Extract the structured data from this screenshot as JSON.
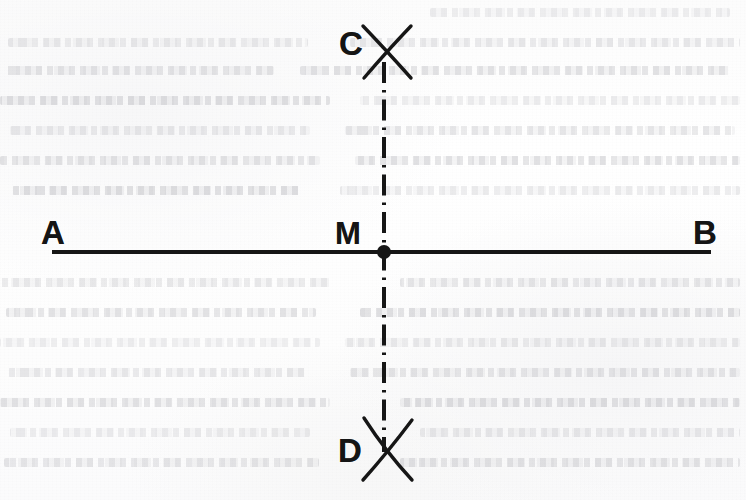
{
  "figure": {
    "kind": "geometry-construction",
    "background_color": "#fdfdfd",
    "ink_color": "#151515"
  },
  "labels": {
    "a": "A",
    "b": "B",
    "m": "M",
    "c": "C",
    "d": "D"
  },
  "elements": {
    "segment_ab": {
      "name": "AB",
      "style": "solid",
      "x1": 52,
      "y1": 252,
      "x2": 711,
      "y2": 252,
      "stroke_width": 4
    },
    "perpendicular_cd": {
      "name": "CD",
      "style": "dash-dot",
      "x1": 384,
      "y1": 62,
      "x2": 384,
      "y2": 452,
      "stroke_width": 4
    },
    "midpoint_m": {
      "name": "M",
      "shape": "filled-dot",
      "cx": 384,
      "cy": 252,
      "r": 7
    },
    "arc_cross_c": {
      "name": "C",
      "cx": 385,
      "cy": 50,
      "x_min": 363,
      "x_max": 411,
      "y_min": 26,
      "y_max": 78
    },
    "arc_cross_d": {
      "name": "D",
      "cx": 385,
      "cy": 455,
      "x_min": 363,
      "x_max": 411,
      "y_min": 418,
      "y_max": 480
    }
  },
  "bleed_through_lines": [
    {
      "left": 430,
      "top": 8,
      "width": 300
    },
    {
      "left": 8,
      "top": 38,
      "width": 300
    },
    {
      "left": 350,
      "top": 38,
      "width": 390
    },
    {
      "left": 4,
      "top": 66,
      "width": 270
    },
    {
      "left": 300,
      "top": 66,
      "width": 430
    },
    {
      "left": 0,
      "top": 96,
      "width": 330
    },
    {
      "left": 360,
      "top": 96,
      "width": 380
    },
    {
      "left": 10,
      "top": 126,
      "width": 300
    },
    {
      "left": 345,
      "top": 126,
      "width": 390
    },
    {
      "left": 0,
      "top": 156,
      "width": 320
    },
    {
      "left": 355,
      "top": 156,
      "width": 385
    },
    {
      "left": 12,
      "top": 186,
      "width": 290
    },
    {
      "left": 340,
      "top": 186,
      "width": 400
    },
    {
      "left": 0,
      "top": 278,
      "width": 330
    },
    {
      "left": 400,
      "top": 278,
      "width": 340
    },
    {
      "left": 6,
      "top": 308,
      "width": 310
    },
    {
      "left": 360,
      "top": 308,
      "width": 380
    },
    {
      "left": 0,
      "top": 338,
      "width": 320
    },
    {
      "left": 345,
      "top": 338,
      "width": 395
    },
    {
      "left": 8,
      "top": 368,
      "width": 300
    },
    {
      "left": 350,
      "top": 368,
      "width": 390
    },
    {
      "left": 0,
      "top": 398,
      "width": 330
    },
    {
      "left": 400,
      "top": 398,
      "width": 340
    },
    {
      "left": 10,
      "top": 428,
      "width": 300
    },
    {
      "left": 420,
      "top": 428,
      "width": 320
    },
    {
      "left": 4,
      "top": 458,
      "width": 315
    },
    {
      "left": 400,
      "top": 458,
      "width": 340
    }
  ]
}
